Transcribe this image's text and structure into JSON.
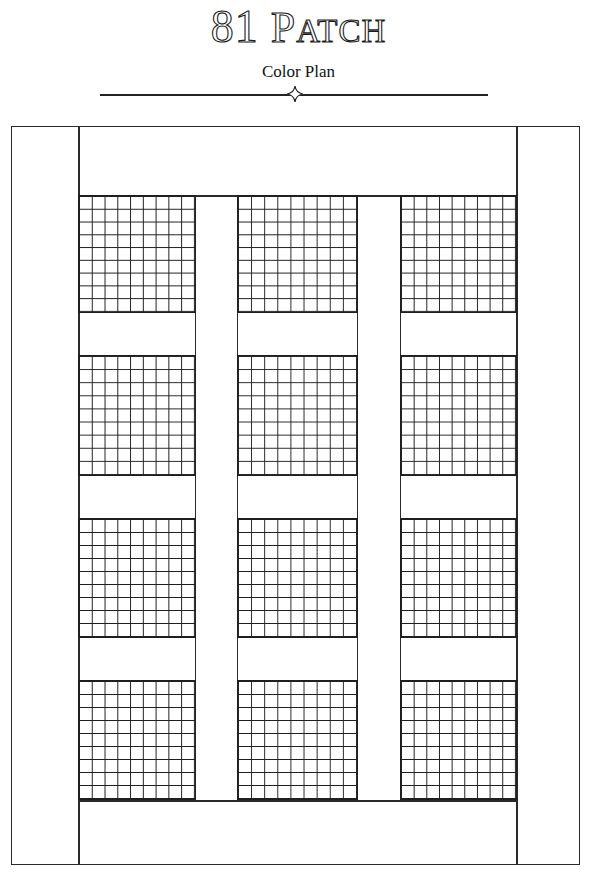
{
  "header": {
    "title_number": "81",
    "title_first_letter": "P",
    "title_rest": "ATCH",
    "subtitle": "Color Plan",
    "ornament": "four-point-star"
  },
  "quilt": {
    "grid_per_block": 9,
    "block_columns": 3,
    "block_rows": 4,
    "line_color": "#2a2a2a",
    "fill_color": "#ffffff",
    "frame": {
      "left": 11,
      "top": 126,
      "right": 580,
      "bottom": 865
    },
    "left_border_right_x": 78,
    "right_border_left_x": 516,
    "top_border_bottom_y": 195,
    "bottom_border_top_y": 800,
    "columns": [
      {
        "left": 78,
        "right": 196
      },
      {
        "left": 237,
        "right": 358
      },
      {
        "left": 400,
        "right": 517
      }
    ],
    "rows": [
      {
        "top": 195,
        "bottom": 313
      },
      {
        "top": 355,
        "bottom": 476
      },
      {
        "top": 518,
        "bottom": 638
      },
      {
        "top": 680,
        "bottom": 800
      }
    ]
  }
}
